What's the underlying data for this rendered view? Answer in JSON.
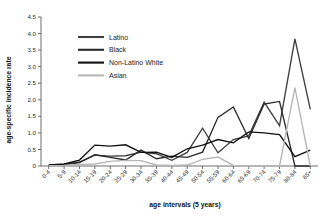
{
  "chart_data": {
    "type": "line",
    "title": "",
    "xlabel": "age intervals (5 years)",
    "ylabel": "age-specific incidence rate",
    "categories": [
      "0-4",
      "5-9",
      "10-14",
      "15-19",
      "20-24",
      "25-29",
      "30-34",
      "35-39",
      "40-44",
      "45-49",
      "50-54",
      "55-59",
      "60-64",
      "65-69",
      "70-74",
      "75-79",
      "80-84",
      "85+"
    ],
    "ylim": [
      0,
      4.5
    ],
    "ytick_labels": [
      "0",
      "0.5",
      "1.0",
      "1.5",
      "2.0",
      "2.5",
      "3.0",
      "3.5",
      "4.0",
      "4.5"
    ],
    "ytick_values": [
      0,
      0.5,
      1.0,
      1.5,
      2.0,
      2.5,
      3.0,
      3.5,
      4.0,
      4.5
    ],
    "grid": false,
    "legend_position": "upper-left-inside",
    "series": [
      {
        "name": "Latino",
        "color": "#3f3f3f",
        "values": [
          0.02,
          0.05,
          0.12,
          0.33,
          0.3,
          0.31,
          0.42,
          0.37,
          0.17,
          0.41,
          1.14,
          0.4,
          0.8,
          0.91,
          1.93,
          1.22,
          3.84,
          1.71
        ]
      },
      {
        "name": "Black",
        "color": "#2a2a2a",
        "values": [
          0.02,
          0.04,
          0.1,
          0.34,
          0.26,
          0.18,
          0.48,
          0.22,
          0.3,
          0.26,
          0.42,
          1.47,
          1.78,
          0.83,
          1.87,
          1.95,
          0.0,
          0.0
        ]
      },
      {
        "name": "Non-Latino White",
        "color": "#111111",
        "values": [
          0.03,
          0.06,
          0.18,
          0.63,
          0.6,
          0.64,
          0.41,
          0.42,
          0.26,
          0.52,
          0.63,
          0.8,
          0.7,
          1.03,
          1.0,
          0.95,
          0.28,
          0.48
        ]
      },
      {
        "name": "Asian",
        "color": "#b6b6b6",
        "values": [
          0.01,
          0.02,
          0.05,
          0.06,
          0.14,
          0.17,
          0.16,
          0.03,
          0.02,
          0.03,
          0.2,
          0.27,
          0.02,
          0.0,
          0.0,
          0.0,
          2.37,
          0.0
        ]
      }
    ]
  },
  "legend": {
    "items": [
      {
        "label": "Latino"
      },
      {
        "label": "Black"
      },
      {
        "label": "Non-Latino White"
      },
      {
        "label": "Asian"
      }
    ]
  },
  "axes": {
    "y_title": "age-specific incidence rate",
    "x_title": "age intervals (5 years)"
  }
}
